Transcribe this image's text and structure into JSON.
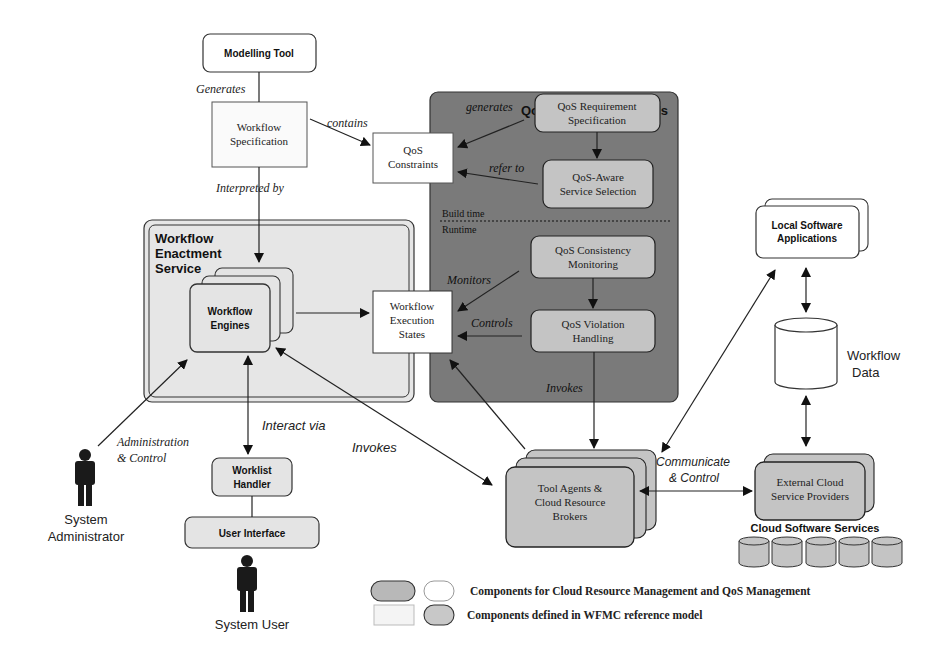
{
  "colors": {
    "dark_panel": "#7a7a7a",
    "light_panel": "#e6e6e6",
    "component_gray": "#c4c4c4",
    "component_light": "#e4e4e4",
    "white": "#ffffff",
    "stroke": "#222222"
  },
  "nodes": {
    "modelling_tool": "Modelling Tool",
    "workflow_spec": [
      "Workflow",
      "Specification"
    ],
    "qos_constraints": [
      "QoS",
      "Constraints"
    ],
    "qos_mgmt_title": "QoS Management Tools",
    "qos_req_spec": [
      "QoS Requirement",
      "Specification"
    ],
    "qos_aware": [
      "QoS-Aware",
      "Service Selection"
    ],
    "build_time": "Build time",
    "runtime": "Runtime",
    "qos_consistency": [
      "QoS Consistency",
      "Monitoring"
    ],
    "qos_violation": [
      "QoS Violation",
      "Handling"
    ],
    "wes_title": [
      "Workflow",
      "Enactment",
      "Service"
    ],
    "workflow_engines": [
      "Workflow",
      "Engines"
    ],
    "workflow_exec_states": [
      "Workflow",
      "Execution",
      "States"
    ],
    "local_software": [
      "Local Software",
      "Applications"
    ],
    "workflow_data": [
      "Workflow",
      "Data"
    ],
    "tool_agents": [
      "Tool Agents &",
      "Cloud Resource",
      "Brokers"
    ],
    "external_cloud": [
      "External Cloud",
      "Service Providers"
    ],
    "cloud_software_services": "Cloud Software Services",
    "worklist_handler": [
      "Worklist",
      "Handler"
    ],
    "user_interface": "User Interface",
    "system_admin": [
      "System",
      "Administrator"
    ],
    "system_user": "System User"
  },
  "edges": {
    "generates": "Generates",
    "contains": "contains",
    "interpreted_by": "Interpreted by",
    "generates_qos": "generates",
    "refer_to": "refer to",
    "monitors": "Monitors",
    "controls": "Controls",
    "invokes_qos": "Invokes",
    "invokes": "Invokes",
    "interact_via": "Interact via",
    "admin_control": [
      "Administration",
      "& Control"
    ],
    "communicate_control": [
      "Communicate",
      "& Control"
    ]
  },
  "legend": {
    "row1": "Components for Cloud Resource Management and QoS Management",
    "row2": "Components defined in WFMC reference model"
  }
}
